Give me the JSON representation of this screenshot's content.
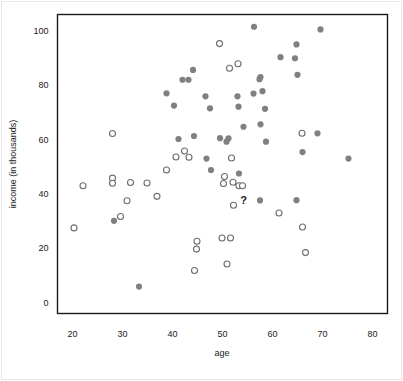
{
  "chart_data": {
    "type": "scatter",
    "title": "",
    "xlabel": "age",
    "ylabel": "income (in thousands)",
    "xlim": [
      17,
      83
    ],
    "ylim": [
      -4,
      106
    ],
    "xticks": [
      20,
      30,
      40,
      50,
      60,
      70,
      80
    ],
    "yticks": [
      0,
      20,
      40,
      60,
      80,
      100
    ],
    "grid": false,
    "legend": false,
    "legend_position": "none",
    "annotations": [
      {
        "text": "?",
        "x": 56.0,
        "y": 37.6
      }
    ],
    "marker_colors": {
      "filled": "#808080",
      "open_stroke": "#6e6e6e",
      "open_fill": "#ffffff",
      "axis": "#1a1a1a"
    },
    "series": [
      {
        "name": "filled",
        "style": "filled-circle",
        "color": "#808080",
        "points": [
          [
            56.3,
            101.5
          ],
          [
            69.6,
            100.5
          ],
          [
            61.6,
            90.3
          ],
          [
            64.8,
            95.0
          ],
          [
            64.5,
            89.9
          ],
          [
            44.1,
            85.6
          ],
          [
            42.0,
            82.0
          ],
          [
            43.2,
            82.0
          ],
          [
            57.6,
            83.0
          ],
          [
            57.4,
            82.2
          ],
          [
            65.0,
            83.8
          ],
          [
            38.8,
            77.0
          ],
          [
            56.2,
            76.9
          ],
          [
            58.0,
            77.8
          ],
          [
            40.3,
            72.5
          ],
          [
            46.6,
            75.9
          ],
          [
            53.0,
            75.9
          ],
          [
            47.5,
            71.5
          ],
          [
            53.2,
            72.1
          ],
          [
            58.5,
            71.3
          ],
          [
            54.2,
            64.7
          ],
          [
            57.6,
            65.6
          ],
          [
            41.2,
            60.2
          ],
          [
            44.3,
            61.3
          ],
          [
            49.5,
            60.5
          ],
          [
            51.2,
            60.4
          ],
          [
            50.8,
            59.2
          ],
          [
            58.7,
            59.2
          ],
          [
            69.0,
            62.3
          ],
          [
            66.0,
            55.4
          ],
          [
            75.2,
            53.0
          ],
          [
            46.8,
            53.0
          ],
          [
            47.7,
            48.8
          ],
          [
            53.3,
            47.5
          ],
          [
            64.8,
            37.7
          ],
          [
            57.5,
            37.6
          ],
          [
            28.3,
            30.1
          ],
          [
            33.3,
            5.9
          ]
        ]
      },
      {
        "name": "open",
        "style": "open-circle",
        "color": "#6e6e6e",
        "points": [
          [
            49.4,
            95.3
          ],
          [
            51.4,
            86.2
          ],
          [
            53.1,
            87.9
          ],
          [
            28.0,
            62.2
          ],
          [
            65.9,
            62.3
          ],
          [
            42.4,
            55.8
          ],
          [
            40.7,
            53.6
          ],
          [
            43.3,
            53.5
          ],
          [
            51.8,
            53.2
          ],
          [
            38.8,
            48.8
          ],
          [
            50.4,
            46.4
          ],
          [
            28.0,
            45.8
          ],
          [
            28.0,
            43.9
          ],
          [
            22.1,
            43.0
          ],
          [
            31.6,
            44.2
          ],
          [
            34.9,
            44.0
          ],
          [
            50.2,
            43.8
          ],
          [
            52.1,
            44.3
          ],
          [
            53.3,
            43.0
          ],
          [
            54.0,
            43.0
          ],
          [
            30.9,
            37.5
          ],
          [
            36.9,
            39.1
          ],
          [
            52.2,
            35.8
          ],
          [
            29.6,
            31.7
          ],
          [
            20.3,
            27.5
          ],
          [
            66.0,
            27.8
          ],
          [
            61.3,
            33.0
          ],
          [
            49.9,
            23.8
          ],
          [
            51.6,
            23.8
          ],
          [
            44.9,
            22.6
          ],
          [
            44.8,
            19.7
          ],
          [
            66.6,
            18.4
          ],
          [
            50.9,
            14.2
          ],
          [
            44.4,
            11.8
          ]
        ]
      }
    ]
  },
  "figure": {
    "xlabel": "age",
    "ylabel": "income (in thousands)",
    "question_marker": "?"
  }
}
